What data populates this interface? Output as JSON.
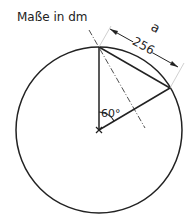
{
  "title": "Maße in dm",
  "labels": {
    "arc_length": "a",
    "chord_length": "256",
    "angle": "60°"
  },
  "colors": {
    "stroke": "#222222"
  }
}
